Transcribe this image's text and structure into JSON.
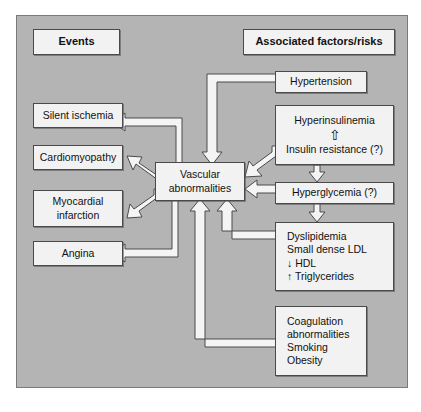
{
  "figure": {
    "panel_color": "#b4b4b4",
    "box_fill": "#f2f2f2",
    "box_border": "#4a4a4a"
  },
  "headers": {
    "left": "Events",
    "right": "Associated factors/risks"
  },
  "center": {
    "line1": "Vascular",
    "line2": "abnormalities"
  },
  "events": [
    {
      "id": "silent-ischemia",
      "label": "Silent ischemia"
    },
    {
      "id": "cardiomyopathy",
      "label": "Cardiomyopathy"
    },
    {
      "id": "myocardial-infarction",
      "line1": "Myocardial",
      "line2": "infarction"
    },
    {
      "id": "angina",
      "label": "Angina"
    }
  ],
  "factors": {
    "hypertension": {
      "label": "Hypertension"
    },
    "hyperinsulinemia": {
      "line1": "Hyperinsulinemia",
      "arrow": "⇧",
      "line2": "Insulin resistance (?)"
    },
    "hyperglycemia": {
      "label": "Hyperglycemia (?)"
    },
    "dyslipidemia": {
      "line1": "Dyslipidemia",
      "line2": "Small dense LDL",
      "line3": "↓ HDL",
      "line4": "↑ Triglycerides"
    },
    "other": {
      "line1": "Coagulation",
      "line2": "abnormalities",
      "line3": "Smoking",
      "line4": "Obesity"
    }
  },
  "edges": [
    {
      "from": "hypertension",
      "to": "vascular-abnormalities",
      "style": "elbow-down"
    },
    {
      "from": "hyperinsulinemia",
      "to": "vascular-abnormalities",
      "style": "diagonal"
    },
    {
      "from": "hyperglycemia",
      "to": "vascular-abnormalities",
      "style": "straight-left"
    },
    {
      "from": "dyslipidemia",
      "to": "vascular-abnormalities",
      "style": "elbow-up"
    },
    {
      "from": "other",
      "to": "vascular-abnormalities",
      "style": "elbow-up"
    },
    {
      "from": "insulin-resistance",
      "to": "hyperinsulinemia",
      "style": "up"
    },
    {
      "from": "hyperinsulinemia",
      "to": "hyperglycemia",
      "style": "down"
    },
    {
      "from": "hyperglycemia",
      "to": "dyslipidemia",
      "style": "down"
    },
    {
      "from": "vascular-abnormalities",
      "to": "silent-ischemia",
      "style": "elbow-left"
    },
    {
      "from": "vascular-abnormalities",
      "to": "cardiomyopathy",
      "style": "diagonal"
    },
    {
      "from": "vascular-abnormalities",
      "to": "myocardial-infarction",
      "style": "diagonal"
    },
    {
      "from": "vascular-abnormalities",
      "to": "angina",
      "style": "elbow-left"
    }
  ]
}
